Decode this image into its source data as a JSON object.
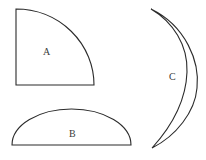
{
  "figure": {
    "background_color": "#ffffff",
    "stroke_color": "#2b2b2b",
    "label_color": "#3a3a3a",
    "shapes": [
      {
        "id": "a",
        "label": "A",
        "kind": "quarter-circle",
        "corner": [
          16,
          85
        ],
        "radius_x": 78,
        "radius_y": 76,
        "label_position": [
          43,
          47
        ]
      },
      {
        "id": "b",
        "label": "B",
        "kind": "semicircle",
        "baseline_y": 145,
        "left_x": 12,
        "right_x": 131,
        "apex_y": 109,
        "label_position": [
          69,
          129
        ]
      },
      {
        "id": "c",
        "label": "C",
        "kind": "lens-crescent",
        "top_point": [
          151,
          9
        ],
        "bottom_point": [
          152,
          148
        ],
        "outer_extent_x": 196,
        "inner_extent_x": 187,
        "label_position": [
          169,
          72
        ]
      }
    ]
  }
}
